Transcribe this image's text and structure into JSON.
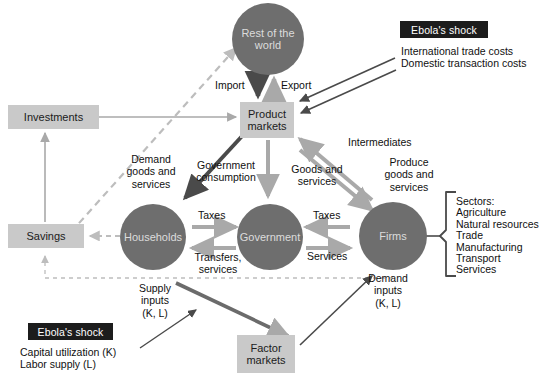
{
  "diagram": {
    "colors": {
      "circle_fill": "#6e6e6e",
      "box_fill": "#c9c9c9",
      "shock_fill": "#1c1c1c",
      "arrow_dark": "#4a4a4a",
      "arrow_light": "#a9a9a9",
      "dashed": "#bdbdbd",
      "text_dark": "#101010",
      "text_on_circle": "#dcdcdc"
    },
    "circles": [
      {
        "id": "rest-of-world",
        "label": "Rest of the\nworld"
      },
      {
        "id": "households",
        "label": "Households"
      },
      {
        "id": "government",
        "label": "Government"
      },
      {
        "id": "firms",
        "label": "Firms"
      }
    ],
    "boxes": [
      {
        "id": "investments",
        "label": "Investments"
      },
      {
        "id": "savings",
        "label": "Savings"
      },
      {
        "id": "product-markets",
        "label": "Product\nmarkets"
      },
      {
        "id": "factor-markets",
        "label": "Factor\nmarkets"
      }
    ],
    "shocks": [
      {
        "id": "shock-top",
        "title": "Ebola's shock",
        "items": "International trade costs\nDomestic transaction costs"
      },
      {
        "id": "shock-bottom",
        "title": "Ebola's shock",
        "items": "Capital utilization (K)\nLabor supply (L)"
      }
    ],
    "flow_labels": [
      {
        "id": "import",
        "text": "Import"
      },
      {
        "id": "export",
        "text": "Export"
      },
      {
        "id": "demand-goods-services",
        "text": "Demand\ngoods and\nservices"
      },
      {
        "id": "government-consumption",
        "text": "Government\nconsumption"
      },
      {
        "id": "goods-and-services",
        "text": "Goods and\nservices"
      },
      {
        "id": "intermediates",
        "text": "Intermediates"
      },
      {
        "id": "produce-goods-services",
        "text": "Produce\ngoods and\nservices"
      },
      {
        "id": "taxes-households",
        "text": "Taxes"
      },
      {
        "id": "transfers-services",
        "text": "Transfers,\nservices"
      },
      {
        "id": "taxes-firms",
        "text": "Taxes"
      },
      {
        "id": "services-firms",
        "text": "Services"
      },
      {
        "id": "supply-inputs",
        "text": "Supply\ninputs\n(K, L)"
      },
      {
        "id": "demand-inputs",
        "text": "Demand\ninputs\n(K, L)"
      }
    ],
    "sectors": {
      "heading": "Sectors:",
      "list": "Sectors:\nAgriculture\nNatural resources\nTrade\nManufacturing\nTransport\nServices"
    }
  }
}
